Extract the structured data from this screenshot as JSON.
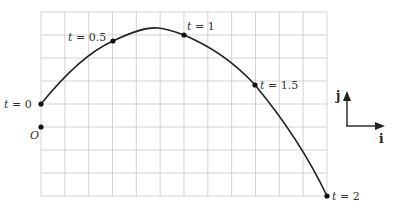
{
  "diagram": {
    "title": "",
    "grid": {
      "x0": 41,
      "y0": 12,
      "cols": 12,
      "rows": 8,
      "dx": 23.83,
      "dy": 23,
      "color": "#c8c8c8"
    },
    "curve_color": "#222222",
    "origin": {
      "label": "O",
      "x": 41,
      "y": 127
    },
    "points": [
      {
        "label": "t = 0",
        "t": "0",
        "x": 41,
        "y": 104,
        "lx": 4,
        "ly": 108
      },
      {
        "label": "t = 0.5",
        "t": "0.5",
        "x": 113,
        "y": 41,
        "lx": 68,
        "ly": 41
      },
      {
        "label": "t = 1",
        "t": "1",
        "x": 184,
        "y": 35,
        "lx": 187,
        "ly": 30
      },
      {
        "label": "t = 1.5",
        "t": "1.5",
        "x": 255,
        "y": 85,
        "lx": 260,
        "ly": 89
      },
      {
        "label": "t = 2",
        "t": "2",
        "x": 327,
        "y": 196,
        "lx": 332,
        "ly": 200
      }
    ],
    "axes_legend": {
      "j_label": "j",
      "i_label": "i"
    }
  },
  "chart_data": {
    "type": "line",
    "title": "",
    "x": [
      0,
      1.5,
      3,
      4.5,
      6
    ],
    "y": [
      1,
      3.7,
      4,
      1.8,
      -3
    ],
    "point_labels": [
      "t = 0",
      "t = 0.5",
      "t = 1",
      "t = 1.5",
      "t = 2"
    ],
    "origin_label": "O",
    "grid": true,
    "grid_units": {
      "cols": 12,
      "rows": 8
    },
    "legend": [
      "i",
      "j"
    ]
  }
}
